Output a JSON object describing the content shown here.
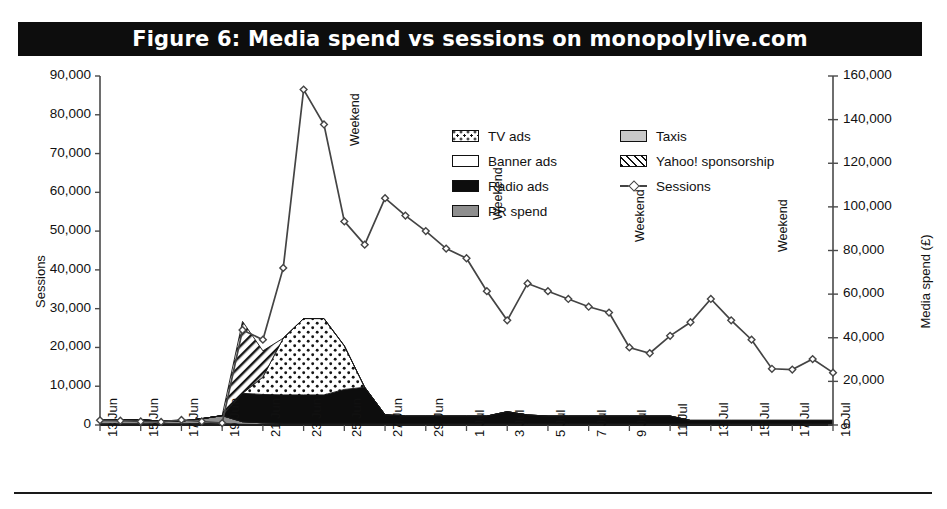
{
  "figure": {
    "title": "Figure 6: Media spend vs sessions on monopolylive.com"
  },
  "axes": {
    "y_left_title": "Sessions",
    "y_right_title": "Media spend (£)",
    "y_left_ticks": [
      "90,000",
      "80,000",
      "70,000",
      "60,000",
      "50,000",
      "40,000",
      "30,000",
      "20,000",
      "10,000",
      "0"
    ],
    "y_right_ticks": [
      "160,000",
      "140,000",
      "120,000",
      "100,000",
      "80,000",
      "60,000",
      "40,000",
      "20,000",
      "0"
    ],
    "x_ticks": [
      "13 Jun",
      "15 Jun",
      "17 Jun",
      "19 Jun",
      "21 Jun",
      "23 Jun",
      "25 Jun",
      "27 Jun",
      "29 Jun",
      "1 Jul",
      "3 Jul",
      "5 Jul",
      "7 Jul",
      "9 Jul",
      "11 Jul",
      "13 Jul",
      "15 Jul",
      "17 Jul",
      "19 Jul"
    ]
  },
  "legend": {
    "items": [
      {
        "label": "TV ads",
        "swatch": "tv-ads-swatch",
        "style": "dotted"
      },
      {
        "label": "Banner ads",
        "swatch": "banner-ads-swatch",
        "style": "white"
      },
      {
        "label": "Radio ads",
        "swatch": "radio-ads-swatch",
        "style": "black"
      },
      {
        "label": "PR spend",
        "swatch": "pr-spend-swatch",
        "style": "gray"
      },
      {
        "label": "Taxis",
        "swatch": "taxis-swatch",
        "style": "lightgray"
      },
      {
        "label": "Yahoo! sponsorship",
        "swatch": "yahoo-sponsorship-swatch",
        "style": "hatched"
      },
      {
        "label": "Sessions",
        "swatch": "sessions-line-marker",
        "style": "line"
      }
    ]
  },
  "annotations": {
    "weekend_label": "Weekend",
    "weekend_markers": [
      {
        "date": "25 Jun",
        "label": "Weekend"
      },
      {
        "date": "2 Jul",
        "label": "Weekend"
      },
      {
        "date": "9 Jul",
        "label": "Weekend"
      },
      {
        "date": "16 Jul",
        "label": "Weekend"
      }
    ]
  },
  "colors": {
    "title_bar": "#0d0d0d",
    "title_text": "#ffffff",
    "radio_ads": "#0d0d0d",
    "tv_ads": "#ffffff",
    "pr_spend": "#8e8e8e",
    "taxis": "#c9c9c9",
    "sessions_line": "#444444",
    "axis": "#4a4a4a"
  },
  "chart_data": {
    "type": "line",
    "title": "Figure 6: Media spend vs sessions on monopolylive.com",
    "xlabel": "",
    "ylabel": "Sessions",
    "y2label": "Media spend (£)",
    "ylim": [
      0,
      90000
    ],
    "y2lim": [
      0,
      160000
    ],
    "grid": false,
    "legend_position": "top-center",
    "x": [
      "13 Jun",
      "14 Jun",
      "15 Jun",
      "16 Jun",
      "17 Jun",
      "18 Jun",
      "19 Jun",
      "20 Jun",
      "21 Jun",
      "22 Jun",
      "23 Jun",
      "24 Jun",
      "25 Jun",
      "26 Jun",
      "27 Jun",
      "28 Jun",
      "29 Jun",
      "30 Jun",
      "1 Jul",
      "2 Jul",
      "3 Jul",
      "4 Jul",
      "5 Jul",
      "6 Jul",
      "7 Jul",
      "8 Jul",
      "9 Jul",
      "10 Jul",
      "11 Jul",
      "12 Jul",
      "13 Jul",
      "14 Jul",
      "15 Jul",
      "16 Jul",
      "17 Jul",
      "18 Jul",
      "19 Jul"
    ],
    "series": [
      {
        "name": "Sessions",
        "axis": "left",
        "unit": "sessions",
        "marker": "open-diamond",
        "values": [
          1200,
          1100,
          900,
          800,
          1300,
          900,
          500,
          24500,
          22000,
          40500,
          86500,
          77500,
          52500,
          46500,
          58500,
          54000,
          50000,
          45500,
          43000,
          34500,
          27000,
          36500,
          34500,
          32500,
          30500,
          29000,
          20000,
          18500,
          23000,
          26500,
          32500,
          27000,
          22000,
          14500,
          14300,
          17000,
          13500
        ]
      },
      {
        "name": "Radio ads",
        "axis": "right",
        "unit": "GBP",
        "fill": "black",
        "values": [
          0,
          0,
          0,
          0,
          0,
          0,
          0,
          13000,
          13000,
          13000,
          13000,
          13000,
          15500,
          16500,
          4000,
          3500,
          3500,
          3500,
          3500,
          3500,
          5500,
          4000,
          3500,
          3500,
          3500,
          3500,
          3500,
          3500,
          3500,
          1500,
          1500,
          1500,
          1500,
          1500,
          1500,
          1500,
          1500
        ]
      },
      {
        "name": "TV ads",
        "axis": "right",
        "unit": "GBP",
        "fill": "dotted",
        "values": [
          0,
          0,
          0,
          0,
          0,
          0,
          0,
          0,
          8000,
          26000,
          35000,
          35000,
          20000,
          0,
          0,
          0,
          0,
          0,
          0,
          0,
          0,
          0,
          0,
          0,
          0,
          0,
          0,
          0,
          0,
          0,
          0,
          0,
          0,
          0,
          0,
          0,
          0
        ]
      },
      {
        "name": "Yahoo! sponsorship",
        "axis": "right",
        "unit": "GBP",
        "fill": "hatched",
        "values": [
          0,
          0,
          0,
          0,
          0,
          0,
          0,
          33000,
          12000,
          0,
          0,
          0,
          0,
          0,
          0,
          0,
          0,
          0,
          0,
          0,
          0,
          0,
          0,
          0,
          0,
          0,
          0,
          0,
          0,
          0,
          0,
          0,
          0,
          0,
          0,
          0,
          0
        ]
      },
      {
        "name": "PR spend",
        "axis": "right",
        "unit": "GBP",
        "fill": "gray",
        "values": [
          1800,
          1900,
          1800,
          1200,
          1200,
          2200,
          3600,
          1200,
          800,
          600,
          600,
          600,
          600,
          600,
          500,
          400,
          400,
          400,
          400,
          400,
          400,
          400,
          400,
          400,
          400,
          400,
          400,
          400,
          400,
          400,
          400,
          400,
          400,
          400,
          400,
          400,
          400
        ]
      },
      {
        "name": "Banner ads",
        "axis": "right",
        "unit": "GBP",
        "fill": "white",
        "values": [
          0,
          0,
          0,
          0,
          0,
          0,
          0,
          0,
          0,
          0,
          0,
          0,
          0,
          0,
          0,
          0,
          0,
          0,
          0,
          0,
          0,
          0,
          0,
          0,
          0,
          0,
          0,
          0,
          0,
          0,
          0,
          0,
          0,
          0,
          0,
          0,
          0
        ]
      },
      {
        "name": "Taxis",
        "axis": "right",
        "unit": "GBP",
        "fill": "lightgray",
        "values": [
          600,
          600,
          600,
          600,
          600,
          700,
          700,
          300,
          200,
          200,
          200,
          200,
          200,
          200,
          200,
          200,
          200,
          200,
          200,
          200,
          200,
          200,
          200,
          200,
          200,
          200,
          200,
          200,
          200,
          200,
          200,
          200,
          200,
          200,
          200,
          200,
          200
        ]
      }
    ]
  }
}
